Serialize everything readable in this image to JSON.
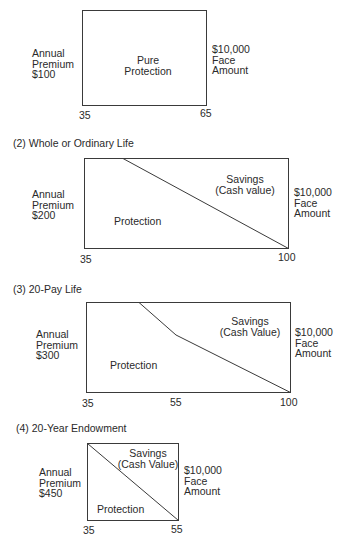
{
  "panels": [
    {
      "heading": "(1) Term",
      "left_label": [
        "Annual",
        "Premium",
        "$100"
      ],
      "right_label": [
        "$10,000",
        "Face",
        "Amount"
      ],
      "regions": [
        "Pure",
        "Protection"
      ],
      "axis_ticks": [
        "35",
        "65"
      ]
    },
    {
      "heading": "(2)  Whole or Ordinary Life",
      "left_label": [
        "Annual",
        "Premium",
        "$200"
      ],
      "right_label": [
        "$10,000",
        "Face",
        "Amount"
      ],
      "savings_label": [
        "Savings",
        "(Cash value)"
      ],
      "protection_label": "Protection",
      "axis_ticks": [
        "35",
        "100"
      ]
    },
    {
      "heading": "(3)  20-Pay Life",
      "left_label": [
        "Annual",
        "Premium",
        "$300"
      ],
      "right_label": [
        "$10,000",
        "Face",
        "Amount"
      ],
      "savings_label": [
        "Savings",
        "(Cash Value)"
      ],
      "protection_label": "Protection",
      "axis_ticks": [
        "35",
        "55",
        "100"
      ]
    },
    {
      "heading": "(4)  20-Year Endowment",
      "left_label": [
        "Annual",
        "Premium",
        "$450"
      ],
      "right_label": [
        "$10,000",
        "Face",
        "Amount"
      ],
      "savings_label": [
        "Savings",
        "(Cash Value)"
      ],
      "protection_label": "Protection",
      "axis_ticks": [
        "35",
        "55"
      ]
    }
  ]
}
